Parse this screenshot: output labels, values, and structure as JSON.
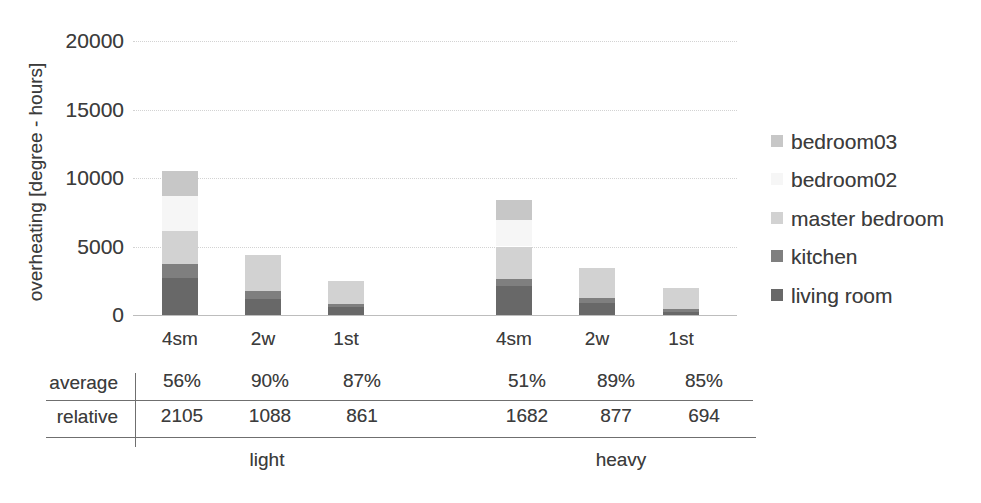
{
  "figure": {
    "background": "#ffffff",
    "text_color": "#3c3c3c"
  },
  "chart_data": {
    "type": "bar",
    "stacked": true,
    "title": "",
    "ylabel": "overheating [degree - hours]",
    "xlabel": "",
    "ylim": [
      0,
      20000
    ],
    "y_ticks": [
      0,
      5000,
      10000,
      15000,
      20000
    ],
    "grid": "horizontal-dotted",
    "legend_position": "right",
    "group_labels": [
      "light",
      "heavy"
    ],
    "categories": [
      "4sm",
      "2w",
      "1st",
      "4sm",
      "2w",
      "1st"
    ],
    "series": [
      {
        "name": "living room",
        "color": "#686868",
        "values": [
          2700,
          1200,
          550,
          2100,
          900,
          250
        ]
      },
      {
        "name": "kitchen",
        "color": "#7f7f7f",
        "values": [
          1000,
          550,
          275,
          500,
          350,
          200
        ]
      },
      {
        "name": "master bedroom",
        "color": "#d2d2d2",
        "values": [
          2400,
          2650,
          1675,
          2400,
          2200,
          1550
        ]
      },
      {
        "name": "bedroom02",
        "color": "#f6f6f6",
        "values": [
          2600,
          0,
          0,
          1950,
          0,
          0
        ]
      },
      {
        "name": "bedroom03",
        "color": "#c7c7c7",
        "values": [
          1800,
          0,
          0,
          1450,
          0,
          0
        ]
      }
    ],
    "legend_order": [
      "bedroom03",
      "bedroom02",
      "master bedroom",
      "kitchen",
      "living room"
    ]
  },
  "table": {
    "row_labels": [
      "average",
      "relative"
    ],
    "rows": [
      [
        "56%",
        "90%",
        "87%",
        "51%",
        "89%",
        "85%"
      ],
      [
        "2105",
        "1088",
        "861",
        "1682",
        "877",
        "694"
      ]
    ],
    "group_labels": [
      "light",
      "heavy"
    ]
  }
}
